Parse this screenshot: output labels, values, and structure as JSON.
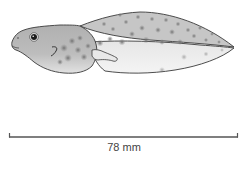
{
  "figure": {
    "colors": {
      "outline": "#3a3a3a",
      "body_fill": "#b9b9b9",
      "tail_upper_fill": "#c4c4c4",
      "tail_lower_fill": "#ececec",
      "spots": "#7a7a7a",
      "eye": "#1a1a1a",
      "scale_bar": "#555555",
      "scale_text": "#444444"
    }
  },
  "scale_bar": {
    "label": "78 mm"
  }
}
